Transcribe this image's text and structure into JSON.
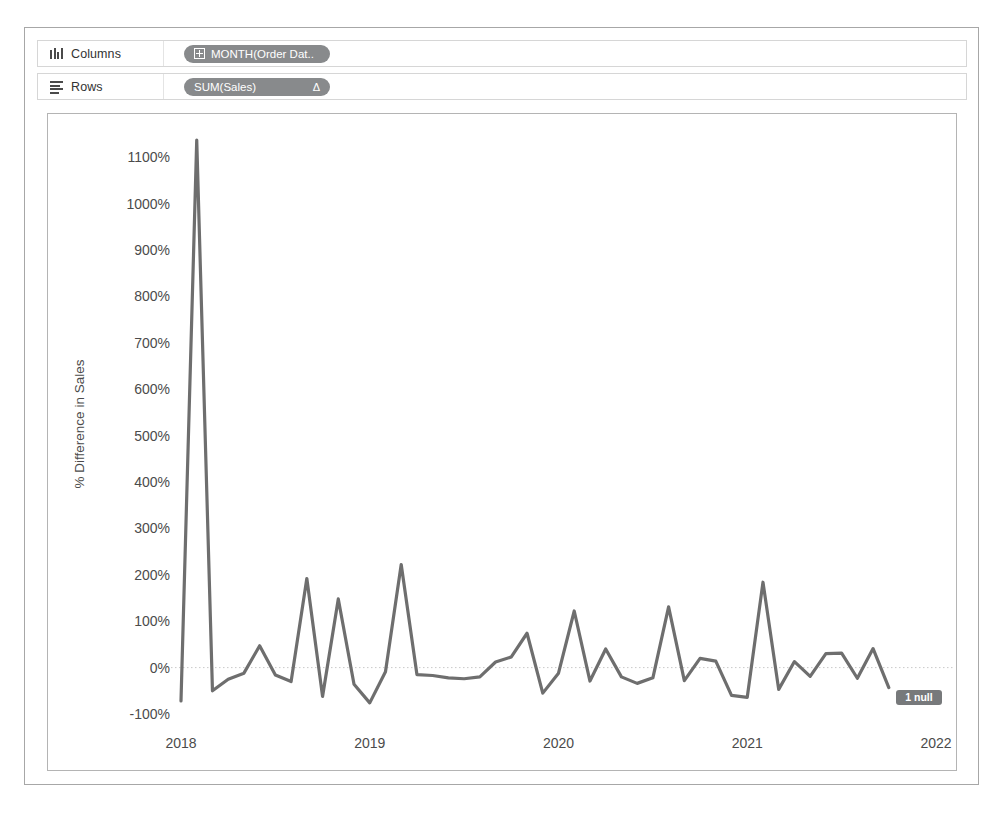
{
  "shelves": {
    "columns": {
      "label": "Columns",
      "icon": "columns-icon",
      "pill": "MONTH(Order Dat.."
    },
    "rows": {
      "label": "Rows",
      "icon": "rows-icon",
      "pill": "SUM(Sales)",
      "sort_glyph": "Δ"
    }
  },
  "chart_data": {
    "type": "line",
    "title": "",
    "xlabel": "Month of Order Date",
    "ylabel": "% Difference in Sales",
    "ylim": [
      -100,
      1150
    ],
    "ytick_labels": [
      "1100%",
      "1000%",
      "900%",
      "800%",
      "700%",
      "600%",
      "500%",
      "400%",
      "300%",
      "200%",
      "100%",
      "0%",
      "-100%"
    ],
    "ytick_values": [
      1100,
      1000,
      900,
      800,
      700,
      600,
      500,
      400,
      300,
      200,
      100,
      0,
      -100
    ],
    "xtick_labels": [
      "2018",
      "2019",
      "2020",
      "2021",
      "2022"
    ],
    "xtick_values": [
      2018,
      2019,
      2020,
      2021,
      2022
    ],
    "grid": false,
    "zero_line": true,
    "legend": "none",
    "line_color": "#6e6e6e",
    "annotations": [
      {
        "name": "null-indicator",
        "text": "1 null"
      }
    ],
    "series": [
      {
        "name": "% Difference in Sales",
        "x": [
          "2018-01",
          "2018-02",
          "2018-03",
          "2018-04",
          "2018-05",
          "2018-06",
          "2018-07",
          "2018-08",
          "2018-09",
          "2018-10",
          "2018-11",
          "2018-12",
          "2019-01",
          "2019-02",
          "2019-03",
          "2019-04",
          "2019-05",
          "2019-06",
          "2019-07",
          "2019-08",
          "2019-09",
          "2019-10",
          "2019-11",
          "2019-12",
          "2020-01",
          "2020-02",
          "2020-03",
          "2020-04",
          "2020-05",
          "2020-06",
          "2020-07",
          "2020-08",
          "2020-09",
          "2020-10",
          "2020-11",
          "2020-12",
          "2021-01",
          "2021-02",
          "2021-03",
          "2021-04",
          "2021-05",
          "2021-06",
          "2021-07",
          "2021-08",
          "2021-09",
          "2021-10",
          "2021-11",
          "2021-12"
        ],
        "values": [
          -72,
          1137,
          -50,
          -25,
          -12,
          47,
          -16,
          -30,
          192,
          -62,
          148,
          -36,
          -76,
          -9,
          222,
          -15,
          -17,
          -22,
          -24,
          -20,
          12,
          23,
          74,
          -55,
          -12,
          122,
          -29,
          40,
          -20,
          -34,
          -22,
          131,
          -28,
          20,
          14,
          -60,
          -64,
          184,
          -47,
          13,
          -19,
          30,
          31,
          -23,
          41,
          -43,
          null,
          null
        ]
      }
    ]
  }
}
